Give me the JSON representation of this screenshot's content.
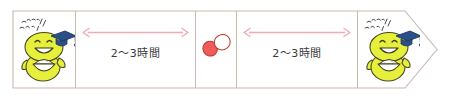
{
  "diagram": {
    "type": "timeline-arrow",
    "title": "",
    "direction": "left-to-right",
    "frame_color": "#c9b8b0",
    "background": "#ffffff",
    "cells": [
      {
        "kind": "character",
        "name": "meal-start",
        "speech_bubble": "いただきます！",
        "character_label": "rice-bowl-character",
        "character_color": "#e7ef3d",
        "cap_color": "#2b4f86"
      },
      {
        "kind": "interval",
        "name": "interval-1",
        "label": "2〜3時間",
        "arrow_color": "#efaab4"
      },
      {
        "kind": "medicine",
        "name": "medicine-dose",
        "pill_label": "capsule",
        "pill_color_a": "#ef5a5a",
        "pill_color_b": "#ffffff"
      },
      {
        "kind": "interval",
        "name": "interval-2",
        "label": "2〜3時間",
        "arrow_color": "#efaab4"
      },
      {
        "kind": "character",
        "name": "meal-end",
        "speech_bubble": "いただきます！",
        "character_label": "rice-bowl-character",
        "character_color": "#e7ef3d",
        "cap_color": "#2b4f86"
      }
    ]
  }
}
